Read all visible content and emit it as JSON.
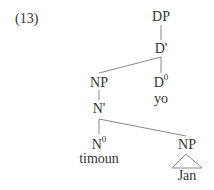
{
  "example_number": "(13)",
  "tree": {
    "nodes": {
      "dp": {
        "label": "DP"
      },
      "d_bar": {
        "label": "D'"
      },
      "np_spec": {
        "label": "NP"
      },
      "d0": {
        "label": "D",
        "sup": "0",
        "word": "yo"
      },
      "n_bar": {
        "label": "N'"
      },
      "n0": {
        "label": "N",
        "sup": "0",
        "word": "timoun"
      },
      "np_comp": {
        "label": "NP",
        "word": "Jan",
        "triangle": true
      }
    },
    "edges": [
      [
        "dp",
        "d_bar"
      ],
      [
        "d_bar",
        "np_spec"
      ],
      [
        "d_bar",
        "d0"
      ],
      [
        "np_spec",
        "n_bar"
      ],
      [
        "n_bar",
        "n0"
      ],
      [
        "n_bar",
        "np_comp"
      ]
    ]
  },
  "colors": {
    "line": "#888888",
    "text": "#333333"
  }
}
